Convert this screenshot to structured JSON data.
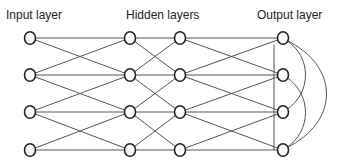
{
  "labels": {
    "input": "Input layer",
    "hidden": "Hidden layers",
    "output": "Output layer"
  },
  "layers": [
    {
      "name": "input",
      "x": 30,
      "nodes": [
        38,
        75,
        112,
        150
      ]
    },
    {
      "name": "hidden-1",
      "x": 130,
      "nodes": [
        38,
        75,
        112,
        150
      ]
    },
    {
      "name": "hidden-2",
      "x": 180,
      "nodes": [
        38,
        75,
        112,
        150
      ]
    },
    {
      "name": "output",
      "x": 283,
      "nodes": [
        38,
        75,
        112,
        150
      ]
    }
  ],
  "connection_pattern": "each node connects to same row and adjacent rows (±1) in next layer",
  "output_lateral": {
    "vertical_line": {
      "x": 274,
      "y1": 45,
      "y2": 150
    },
    "curves": [
      {
        "from": 0,
        "to": 2,
        "bulge_x": 312
      },
      {
        "from": 1,
        "to": 3,
        "bulge_x": 312
      },
      {
        "from": 0,
        "to": 3,
        "bulge_x": 340
      }
    ]
  },
  "colors": {
    "edge": "#555555",
    "node_stroke": "#222222",
    "text": "#222222",
    "background": "#ffffff"
  }
}
